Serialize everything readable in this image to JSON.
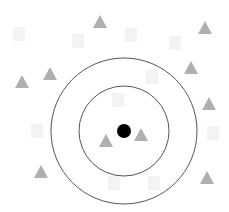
{
  "diagram": {
    "width": 229,
    "height": 212,
    "background": "#ffffff",
    "center": {
      "x": 124,
      "y": 131,
      "r": 7,
      "color": "#000000"
    },
    "rings": [
      {
        "r": 45,
        "stroke": "#555555",
        "width": 1
      },
      {
        "r": 73,
        "stroke": "#555555",
        "width": 1
      }
    ],
    "triangle_color": "#b0b0b0",
    "square_color": "#f3f3f3",
    "triangles": [
      {
        "x": 100,
        "y": 22
      },
      {
        "x": 205,
        "y": 28
      },
      {
        "x": 50,
        "y": 74
      },
      {
        "x": 22,
        "y": 82
      },
      {
        "x": 191,
        "y": 68
      },
      {
        "x": 209,
        "y": 104
      },
      {
        "x": 106,
        "y": 141
      },
      {
        "x": 141,
        "y": 135
      },
      {
        "x": 41,
        "y": 172
      },
      {
        "x": 207,
        "y": 178
      }
    ],
    "squares": [
      {
        "x": 19,
        "y": 34
      },
      {
        "x": 131,
        "y": 35
      },
      {
        "x": 175,
        "y": 43
      },
      {
        "x": 78,
        "y": 41
      },
      {
        "x": 152,
        "y": 77
      },
      {
        "x": 118,
        "y": 100
      },
      {
        "x": 37,
        "y": 131
      },
      {
        "x": 213,
        "y": 133
      },
      {
        "x": 154,
        "y": 183
      },
      {
        "x": 114,
        "y": 183
      }
    ]
  }
}
